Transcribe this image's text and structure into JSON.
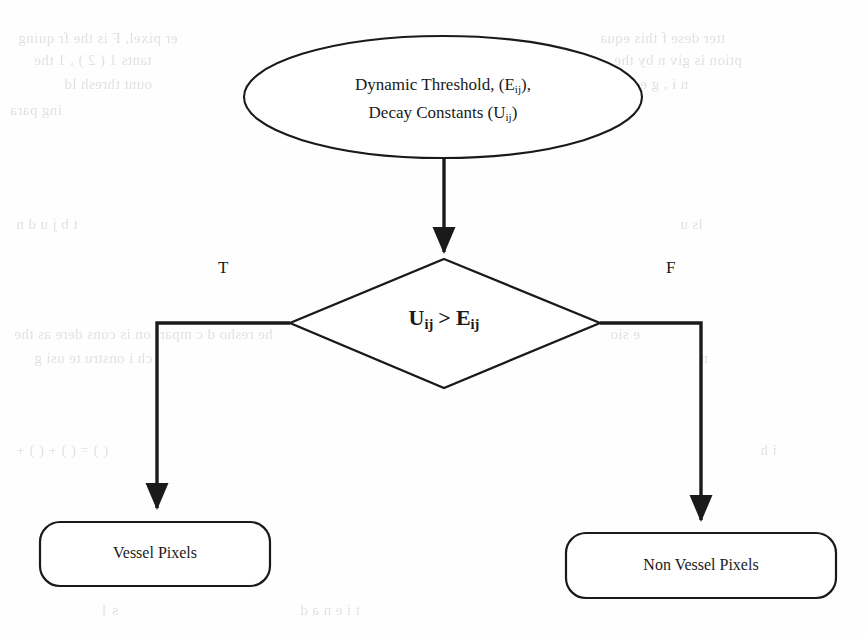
{
  "diagram": {
    "start_node": {
      "shape": "ellipse",
      "line1_prefix": "Dynamic Threshold, (E",
      "line1_sub": "ij",
      "line1_suffix": "),",
      "line2_prefix": "Decay Constants (U",
      "line2_sub": "ij",
      "line2_suffix": ")",
      "line1_plain": "Dynamic Threshold, (Eij),",
      "line2_plain": "Decay Constants (Uij)"
    },
    "decision_node": {
      "shape": "diamond",
      "left_var": "U",
      "left_sub": "ij",
      "operator": ">",
      "right_var": "E",
      "right_sub": "ij",
      "condition_plain": "Uij > Eij"
    },
    "branches": [
      {
        "label": "T",
        "name": "true-branch",
        "target": "Vessel Pixels"
      },
      {
        "label": "F",
        "name": "false-branch",
        "target": "Non Vessel Pixels"
      }
    ],
    "outcome_nodes": [
      {
        "shape": "rounded-rectangle",
        "label": "Vessel Pixels"
      },
      {
        "shape": "rounded-rectangle",
        "label": "Non Vessel Pixels"
      }
    ],
    "colors": {
      "stroke": "#1a1a1a",
      "fill": "#ffffff",
      "text": "#1a1a1a",
      "background": "#fefefe",
      "bleed_text": "#b9b9b9"
    }
  },
  "background_bleed": {
    "note": "faint mirrored show-through text from reverse of scanned page",
    "lines": [
      {
        "text": "er pixel, F  is the fr quing",
        "x": 18,
        "y": 40,
        "size": 16
      },
      {
        "text": "tants   1 ( 2 ) , 1   the",
        "x": 34,
        "y": 62,
        "size": 16
      },
      {
        "text": "ount thresh ld",
        "x": 64,
        "y": 86,
        "size": 16
      },
      {
        "text": "ing para",
        "x": 10,
        "y": 112,
        "size": 16
      },
      {
        "text": "tter  dese   f   this  equa",
        "x": 600,
        "y": 40,
        "size": 16
      },
      {
        "text": "ption is giv n by the",
        "x": 614,
        "y": 62,
        "size": 16
      },
      {
        "text": "n   i  ,  g    e  n",
        "x": 628,
        "y": 86,
        "size": 16
      },
      {
        "text": "t  b    j     u    d  n",
        "x": 16,
        "y": 226,
        "size": 16
      },
      {
        "text": "he  resho d c mpari on is cons dere   as the",
        "x": 14,
        "y": 336,
        "size": 15
      },
      {
        "text": "ch   i    onstru te  usi g",
        "x": 34,
        "y": 360,
        "size": 15
      },
      {
        "text": "( ) = ( ) +   ( ) +",
        "x": 16,
        "y": 452,
        "size": 15
      },
      {
        "text": "e  sio",
        "x": 610,
        "y": 336,
        "size": 15
      },
      {
        "text": "n",
        "x": 700,
        "y": 360,
        "size": 15
      },
      {
        "text": "ls   u",
        "x": 680,
        "y": 226,
        "size": 15
      },
      {
        "text": "i  h",
        "x": 760,
        "y": 452,
        "size": 15
      },
      {
        "text": "s   1",
        "x": 100,
        "y": 612,
        "size": 15
      },
      {
        "text": "t     i    e    n  a   d",
        "x": 300,
        "y": 612,
        "size": 15
      }
    ]
  }
}
